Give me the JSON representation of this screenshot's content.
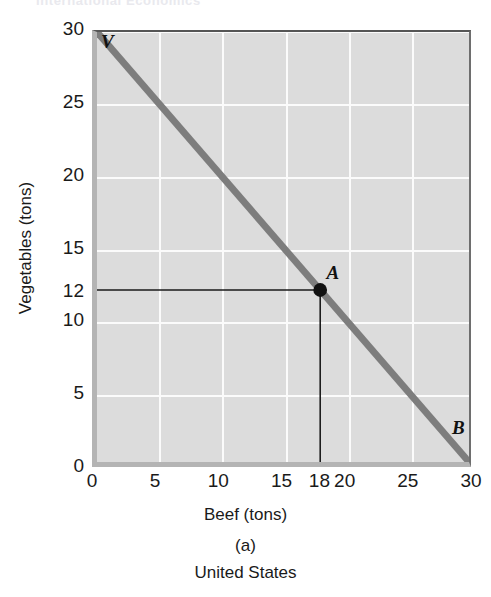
{
  "running_head": "International Economics",
  "chart_data": {
    "type": "line",
    "title": "United States",
    "panel": "(a)",
    "xlabel": "Beef (tons)",
    "ylabel": "Vegetables (tons)",
    "xlim": [
      0,
      30
    ],
    "ylim": [
      0,
      30
    ],
    "grid": true,
    "legend": "none",
    "xticks": [
      0,
      5,
      10,
      15,
      18,
      20,
      25,
      30
    ],
    "xtick_labels": [
      "0",
      "5",
      "10",
      "15",
      "18",
      "20",
      "25",
      "30"
    ],
    "yticks": [
      0,
      5,
      10,
      12,
      15,
      20,
      25,
      30
    ],
    "ytick_labels": [
      "0",
      "5",
      "10",
      "12",
      "15",
      "20",
      "25",
      "30"
    ],
    "xgridlines": [
      5,
      10,
      15,
      20,
      25
    ],
    "ygridlines": [
      5,
      10,
      15,
      20,
      25,
      30
    ],
    "series": [
      {
        "name": "Production possibility frontier",
        "color": "#7d7d7d",
        "x": [
          0,
          30
        ],
        "y": [
          30,
          0
        ]
      }
    ],
    "points": [
      {
        "label": "A",
        "x": 18,
        "y": 12,
        "color": "#111111"
      }
    ],
    "endpoint_labels": [
      {
        "label": "V",
        "x": 0,
        "y": 30
      },
      {
        "label": "B",
        "x": 30,
        "y": 0
      }
    ],
    "droplines": [
      {
        "name": "vertical-dropline-at-18",
        "orientation": "vertical",
        "x": 18,
        "from_y": 0,
        "to_y": 12
      },
      {
        "name": "horizontal-dropline-at-12",
        "orientation": "horizontal",
        "y": 12,
        "from_x": 0,
        "to_x": 18
      }
    ],
    "colors": {
      "plot_background": "#dcdcdc",
      "gridline": "#fbfbfb",
      "frontier": "#7d7d7d",
      "dropline": "#1a1a1a",
      "axis_frame": "#b4b4b4"
    }
  }
}
